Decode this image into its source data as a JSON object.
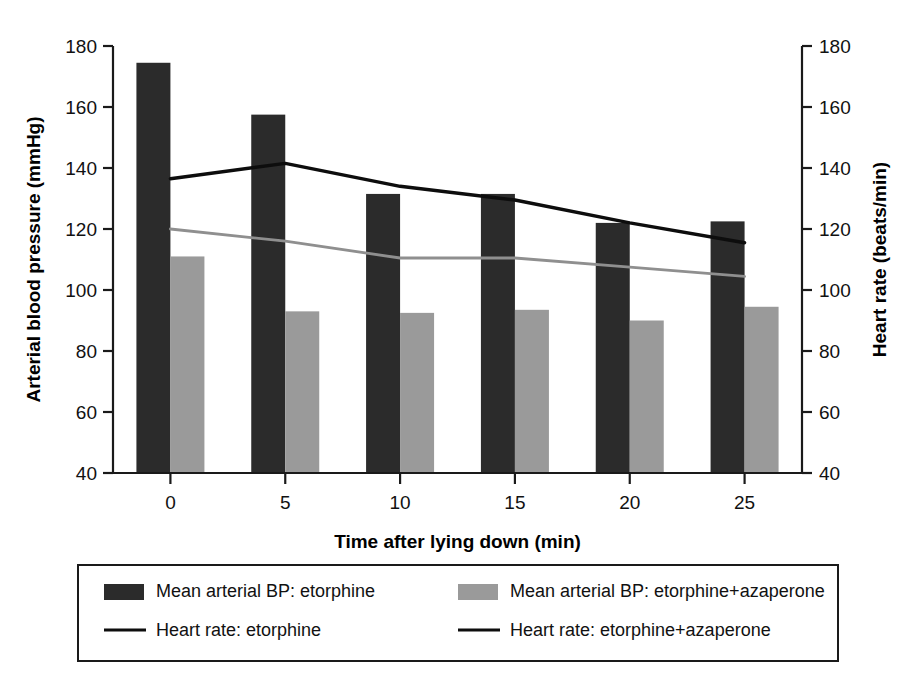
{
  "chart_data": {
    "type": "bar",
    "title": "",
    "xlabel": "Time after lying down (min)",
    "ylabel": "Arterial blood pressure (mmHg)",
    "y2label": "Heart rate (beats/min)",
    "categories": [
      "0",
      "5",
      "10",
      "15",
      "20",
      "25"
    ],
    "x": [
      0,
      5,
      10,
      15,
      20,
      25
    ],
    "ylim": [
      40,
      180
    ],
    "y2lim": [
      40,
      180
    ],
    "yticks": [
      40,
      60,
      80,
      100,
      120,
      140,
      160,
      180
    ],
    "y2ticks": [
      40,
      60,
      80,
      100,
      120,
      140,
      160,
      180
    ],
    "grid": false,
    "legend_position": "below",
    "series": [
      {
        "name": "Mean arterial BP: etorphine",
        "kind": "bar",
        "axis": "left",
        "color": "#2b2b2b",
        "values": [
          174.5,
          157.5,
          131.5,
          131.5,
          122.0,
          122.5
        ]
      },
      {
        "name": "Mean arterial BP: etorphine+azaperone",
        "kind": "bar",
        "axis": "left",
        "color": "#9a9a9a",
        "values": [
          111.0,
          93.0,
          92.5,
          93.5,
          90.0,
          94.5
        ]
      },
      {
        "name": "Heart rate: etorphine",
        "kind": "line",
        "axis": "right",
        "color": "#0d0d0d",
        "values": [
          136.5,
          141.5,
          134.0,
          129.5,
          122.0,
          115.5
        ]
      },
      {
        "name": "Heart rate: etorphine+azaperone",
        "kind": "line",
        "axis": "right",
        "color": "#8f8f8f",
        "values": [
          120.0,
          116.0,
          110.5,
          110.5,
          107.5,
          104.5
        ]
      }
    ]
  },
  "legend": {
    "entries": [
      {
        "label": "Mean arterial BP: etorphine",
        "marker": "swatch-dark"
      },
      {
        "label": "Mean arterial BP: etorphine+azaperone",
        "marker": "swatch-light"
      },
      {
        "label": "Heart rate: etorphine",
        "marker": "line-dark"
      },
      {
        "label": "Heart rate: etorphine+azaperone",
        "marker": "line-dark"
      }
    ]
  }
}
